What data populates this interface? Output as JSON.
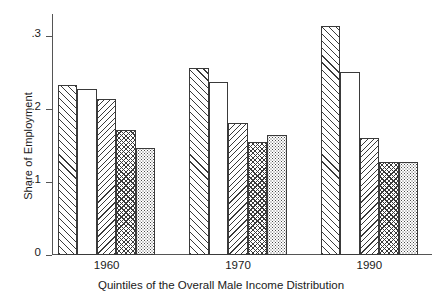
{
  "chart_data": {
    "type": "bar",
    "title": "",
    "xlabel": "Quintiles of the Overall Male Income Distribution",
    "ylabel": "Share of Employment",
    "categories": [
      "1960",
      "1970",
      "1990"
    ],
    "ylim": [
      0,
      0.33
    ],
    "yticks": [
      0,
      0.1,
      0.2,
      0.3
    ],
    "ytick_labels": [
      "0",
      ".1",
      ".2",
      ".3"
    ],
    "grid": false,
    "legend": "none",
    "series": [
      {
        "name": "Quintile 1",
        "pattern": "diagonal-up-hatch",
        "values": [
          0.233,
          0.256,
          0.313
        ]
      },
      {
        "name": "Quintile 2",
        "pattern": "blank",
        "values": [
          0.227,
          0.237,
          0.251
        ]
      },
      {
        "name": "Quintile 3",
        "pattern": "diagonal-down-hatch",
        "values": [
          0.214,
          0.181,
          0.16
        ]
      },
      {
        "name": "Quintile 4",
        "pattern": "crosshatch",
        "values": [
          0.171,
          0.155,
          0.128
        ]
      },
      {
        "name": "Quintile 5",
        "pattern": "fine-dots",
        "values": [
          0.147,
          0.164,
          0.128
        ]
      }
    ],
    "colors": {
      "axis": "#555555",
      "bar_outline": "#3a3a3a",
      "bar_fill": "#ffffff",
      "background": "#ffffff",
      "text": "#1a1a1a"
    }
  },
  "axis": {
    "ytick_labels": [
      "0",
      ".1",
      ".2",
      ".3"
    ],
    "xgroup_labels": [
      "1960",
      "1970",
      "1990"
    ],
    "ylabel": "Share of Employment",
    "xlabel": "Quintiles of the Overall Male Income Distribution"
  }
}
